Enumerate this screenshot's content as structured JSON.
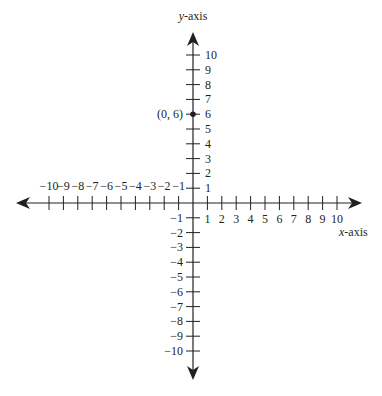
{
  "chart_data": {
    "type": "scatter",
    "title": "",
    "xlabel": "x-axis",
    "ylabel": "y-axis",
    "xlim": [
      -10,
      10
    ],
    "ylim": [
      -10,
      10
    ],
    "x_ticks": [
      -10,
      -9,
      -8,
      -7,
      -6,
      -5,
      -4,
      -3,
      -2,
      -1,
      1,
      2,
      3,
      4,
      5,
      6,
      7,
      8,
      9,
      10
    ],
    "y_ticks": [
      -10,
      -9,
      -8,
      -7,
      -6,
      -5,
      -4,
      -3,
      -2,
      -1,
      1,
      2,
      3,
      4,
      5,
      6,
      7,
      8,
      9,
      10
    ],
    "grid": false,
    "points": [
      {
        "x": 0,
        "y": 6,
        "label": "(0, 6)"
      }
    ]
  },
  "labels": {
    "y_axis_italic": "y",
    "y_axis_rest": "-axis",
    "x_axis_italic": "x",
    "x_axis_rest": "-axis",
    "point": "(0, 6)"
  },
  "colors": {
    "ink": "#231f20",
    "background": "#ffffff"
  }
}
